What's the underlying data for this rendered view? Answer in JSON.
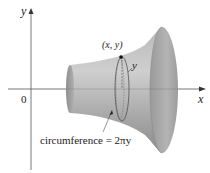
{
  "figure": {
    "type": "surface-of-revolution",
    "axes": {
      "x_label": "x",
      "y_label": "y",
      "origin_label": "0"
    },
    "point_label": "(x, y)",
    "radius_label": "y",
    "circumference_label": "circumference = 2πy",
    "colors": {
      "surface_light": "#c9c9c9",
      "surface_dark": "#8a8a8a",
      "axis": "#555555",
      "text": "#222222"
    }
  }
}
